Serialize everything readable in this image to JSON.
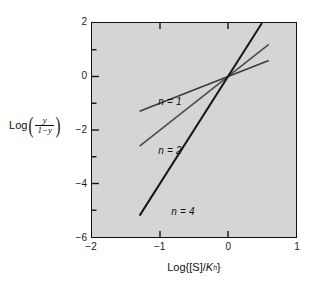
{
  "chart_data": {
    "type": "line",
    "title": "",
    "subtitle": "",
    "xlabel_plain": "Log{[S]/Kh}",
    "ylabel_plain": "Log(y/(1-y))",
    "xlim": [
      -2,
      1
    ],
    "ylim": [
      -6,
      2
    ],
    "grid": false,
    "legend_position": "inline-annotation",
    "background_color": "#d5d5d5",
    "axis_color": "#111111",
    "xticks": [
      "-2",
      "-1",
      "0",
      "1"
    ],
    "xtick_values": [
      -2,
      -1,
      0,
      1
    ],
    "yticks": [
      "2",
      "0",
      "-2",
      "-4",
      "-6"
    ],
    "ytick_values": [
      2,
      0,
      -2,
      -4,
      -6
    ],
    "y_minor_tick_values": [
      1,
      -1,
      -3,
      -5
    ],
    "x_minor_tick_values": [],
    "series": [
      {
        "name": "n = 1",
        "hill_coefficient": 1,
        "slope": 1,
        "intercept": 0,
        "color": "#3a3a3a",
        "line_width": 1.5,
        "x": [
          -1.3,
          0.6
        ],
        "values": [
          -1.3,
          0.6
        ],
        "label_x": -1.02,
        "label_y": -0.95
      },
      {
        "name": "n = 2",
        "hill_coefficient": 2,
        "slope": 2,
        "intercept": 0,
        "color": "#4a4a4a",
        "line_width": 1.6,
        "x": [
          -1.3,
          0.6
        ],
        "values": [
          -2.6,
          1.2
        ],
        "label_x": -1.02,
        "label_y": -2.78
      },
      {
        "name": "n = 4",
        "hill_coefficient": 4,
        "slope": 4,
        "intercept": 0,
        "color": "#161616",
        "line_width": 2.0,
        "x": [
          -1.3,
          0.5
        ],
        "values": [
          -5.2,
          2.0
        ],
        "label_x": -0.83,
        "label_y": -5.05
      }
    ],
    "annotations": [
      {
        "text": "n = 1",
        "x": -1.02,
        "y": -0.95
      },
      {
        "text": "n = 2",
        "x": -1.02,
        "y": -2.78
      },
      {
        "text": "n = 4",
        "x": -0.83,
        "y": -5.05
      }
    ],
    "intersection_point": {
      "x": 0,
      "y": 0
    }
  },
  "axes": {
    "x_title_parts": {
      "log": "Log",
      "open_brace": "{",
      "bracket_s": "[S]",
      "slash": "/",
      "k": "K",
      "k_sub": "h",
      "close_brace": "}"
    },
    "y_title_parts": {
      "log": "Log",
      "numerator": "y",
      "denominator": "1−y"
    }
  },
  "series_labels": {
    "n1": "n = 1",
    "n2": "n = 2",
    "n4": "n = 4"
  },
  "xtick_labels": [
    "−2",
    "−1",
    "0",
    "1"
  ],
  "ytick_labels": [
    "2",
    "0",
    "−2",
    "−4",
    "−6"
  ]
}
